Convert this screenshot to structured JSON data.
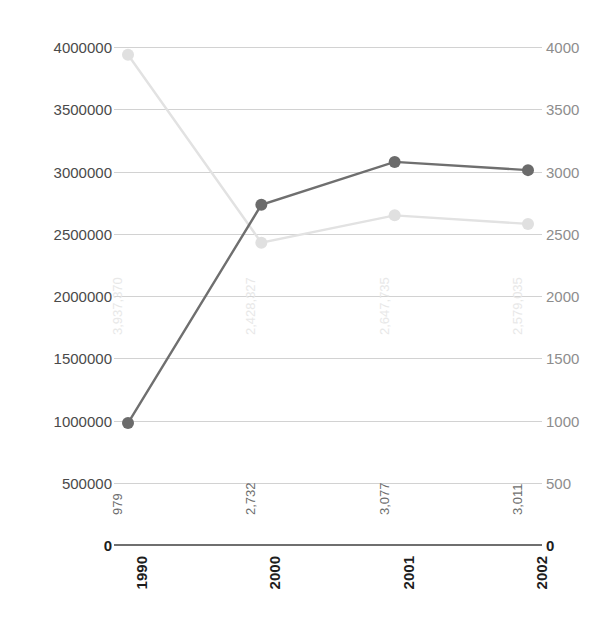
{
  "chart_data": {
    "type": "line",
    "title": "",
    "subtitle": "",
    "xlabel": "",
    "ylabel": "",
    "categories": [
      "1990",
      "2000",
      "2001",
      "2002"
    ],
    "grid": true,
    "legend": "none",
    "axes": {
      "left": {
        "ticks": [
          "0",
          "500000",
          "1000000",
          "1500000",
          "2000000",
          "2500000",
          "3000000",
          "3500000",
          "4000000"
        ],
        "tick_values": [
          0,
          500000,
          1000000,
          1500000,
          2000000,
          2500000,
          3000000,
          3500000,
          4000000
        ],
        "ylim": [
          0,
          4000000
        ]
      },
      "right": {
        "ticks": [
          "0",
          "500",
          "1000",
          "1500",
          "2000",
          "2500",
          "3000",
          "3500",
          "4000"
        ],
        "tick_values": [
          0,
          500,
          1000,
          1500,
          2000,
          2500,
          3000,
          3500,
          4000
        ],
        "ylim": [
          0,
          4000
        ]
      }
    },
    "series": [
      {
        "name": "light-series",
        "axis": "left",
        "color": "#e2e2e2",
        "marker_color": "#e0e0e0",
        "values": [
          3937370,
          2428327,
          2647735,
          2579035
        ],
        "labels": [
          "3,937,370",
          "2,428,327",
          "2,647,735",
          "2,579,035"
        ]
      },
      {
        "name": "dark-series",
        "axis": "right",
        "color": "#6f6f6f",
        "marker_color": "#6b6b6b",
        "values": [
          979,
          2732,
          3077,
          3011
        ],
        "labels": [
          "979",
          "2,732",
          "3,077",
          "3,011"
        ]
      }
    ]
  },
  "colors": {
    "background": "#ffffff",
    "gridline": "#d2d2d2",
    "baseline": "#6f6f6f",
    "axis_text_left": "#4a4a4a",
    "axis_text_right": "#8d8d8d",
    "dark_series": "#6f6f6f",
    "light_series": "#e2e2e2",
    "dark_label": "#6e6e6e",
    "light_label": "#e8e8e8"
  }
}
